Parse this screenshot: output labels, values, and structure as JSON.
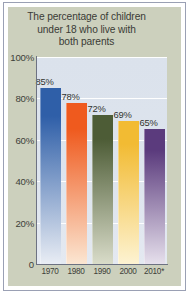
{
  "chart_data": {
    "type": "bar",
    "title": "The percentage of children under 18 who live with both parents",
    "title_lines": [
      "The percentage of children",
      "under 18 who live with",
      "both parents"
    ],
    "categories": [
      "1970",
      "1980",
      "1990",
      "2000",
      "2010*"
    ],
    "values": [
      85,
      78,
      72,
      69,
      65
    ],
    "value_labels": [
      "85%",
      "78%",
      "72%",
      "69%",
      "65%"
    ],
    "xlabel": "",
    "ylabel": "",
    "ylim": [
      0,
      100
    ],
    "ytick_values": [
      100,
      80,
      60,
      40,
      20,
      0
    ],
    "ytick_labels": [
      "100%",
      "80%",
      "60%",
      "40%",
      "20%",
      "0"
    ],
    "grid": true,
    "grid_orientation": "horizontal",
    "legend": false,
    "series": [
      {
        "name": "Children under 18 living with both parents",
        "values": [
          85,
          78,
          72,
          69,
          65
        ]
      }
    ],
    "bar_colors": [
      "#2f5fa8",
      "#ef5a1e",
      "#4d5c36",
      "#f2bb33",
      "#5b3b7d"
    ],
    "bar_colors_bottom": [
      "#e9edf4",
      "#fbe6d2",
      "#d9dcc9",
      "#fdf3d2",
      "#e6e0ec"
    ],
    "annotations": [
      {
        "text": "*",
        "meaning": "2010 figure marked with asterisk"
      }
    ]
  },
  "style": {
    "panel_color": "#ccd0bd",
    "plot_background": "#dce3ed",
    "gridline_color": "#ffffff",
    "axis_color": "#6d7282",
    "text_color": "#3a3b36",
    "frame_color": "#9aa0b4",
    "page_background": "#ffffff"
  }
}
